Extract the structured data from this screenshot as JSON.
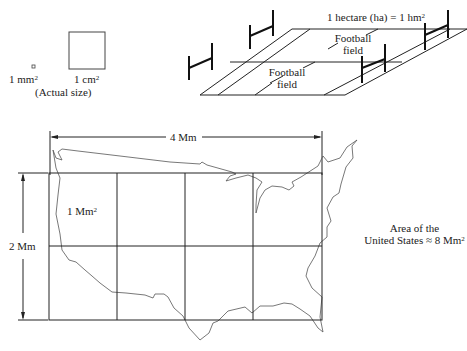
{
  "small_units": {
    "mm2_label": "1 mm",
    "mm2_sup": "2",
    "cm2_label": "1 cm",
    "cm2_sup": "2",
    "caption": "(Actual size)"
  },
  "hectare": {
    "title": "1 hectare (ha) = 1 hm",
    "title_sup": "2",
    "field_top_line1": "Football",
    "field_top_line2": "field",
    "field_bottom_line1": "Football",
    "field_bottom_line2": "field"
  },
  "map": {
    "width_label": "4 Mm",
    "height_label": "2 Mm",
    "cell_label": "1 Mm",
    "cell_sup": "2",
    "grid_cols": 4,
    "grid_rows": 2,
    "area_line1": "Area of the",
    "area_line2": "United States ≈ 8 Mm",
    "area_sup": "2"
  },
  "colors": {
    "line": "#222222",
    "outline": "#555555",
    "background": "#ffffff"
  }
}
